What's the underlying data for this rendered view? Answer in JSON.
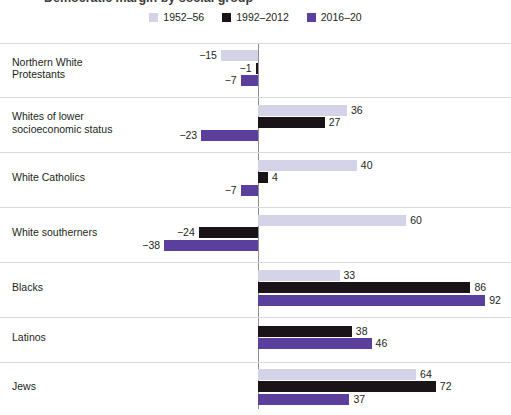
{
  "chart": {
    "title": "Democratic margin by social group",
    "type": "bar"
  },
  "legend": {
    "position": "top-center",
    "items": [
      {
        "label": "1952–56",
        "color": "#d5d3e8",
        "key": "s1952"
      },
      {
        "label": "1992–2012",
        "color": "#1a1419",
        "key": "s1992"
      },
      {
        "label": "2016–20",
        "color": "#5b3f9d",
        "key": "s2016"
      }
    ]
  },
  "axis": {
    "zero_label": "0",
    "px_per_unit": 2.47,
    "zero_x": 258
  },
  "chart_data": {
    "type": "bar",
    "orientation": "horizontal",
    "title": "Democratic margin by social group",
    "xlabel": "",
    "ylabel": "",
    "grid": false,
    "legend_position": "top-center",
    "xlim": [
      -38,
      92
    ],
    "categories": [
      "Northern White\nProtestants",
      "Whites of lower\nsocioeconomic status",
      "White Catholics",
      "White southerners",
      "Blacks",
      "Latinos",
      "Jews"
    ],
    "series": [
      {
        "name": "1952–56",
        "color": "#d5d3e8",
        "values": [
          -15,
          36,
          40,
          60,
          33,
          null,
          64
        ]
      },
      {
        "name": "1992–2012",
        "color": "#1a1419",
        "values": [
          -1,
          27,
          4,
          -24,
          86,
          38,
          72
        ]
      },
      {
        "name": "2016–20",
        "color": "#5b3f9d",
        "values": [
          -7,
          -23,
          -7,
          -38,
          92,
          46,
          37
        ]
      }
    ],
    "value_labels": [
      [
        "−15",
        "36",
        "40",
        "60",
        "33",
        "",
        "64"
      ],
      [
        "−1",
        "27",
        "4",
        "−24",
        "86",
        "38",
        "72"
      ],
      [
        "−7",
        "−23",
        "−7",
        "−38",
        "92",
        "46",
        "37"
      ]
    ]
  },
  "rows": [
    {
      "label": "Northern White\nProtestants",
      "top": 0,
      "height": 54
    },
    {
      "label": "Whites of lower\nsocioeconomic status",
      "top": 54,
      "height": 55
    },
    {
      "label": "White Catholics",
      "top": 109,
      "height": 55
    },
    {
      "label": "White southerners",
      "top": 164,
      "height": 55
    },
    {
      "label": "Blacks",
      "top": 219,
      "height": 55
    },
    {
      "label": "Latinos",
      "top": 274,
      "height": 45
    },
    {
      "label": "Jews",
      "top": 319,
      "height": 53
    }
  ]
}
